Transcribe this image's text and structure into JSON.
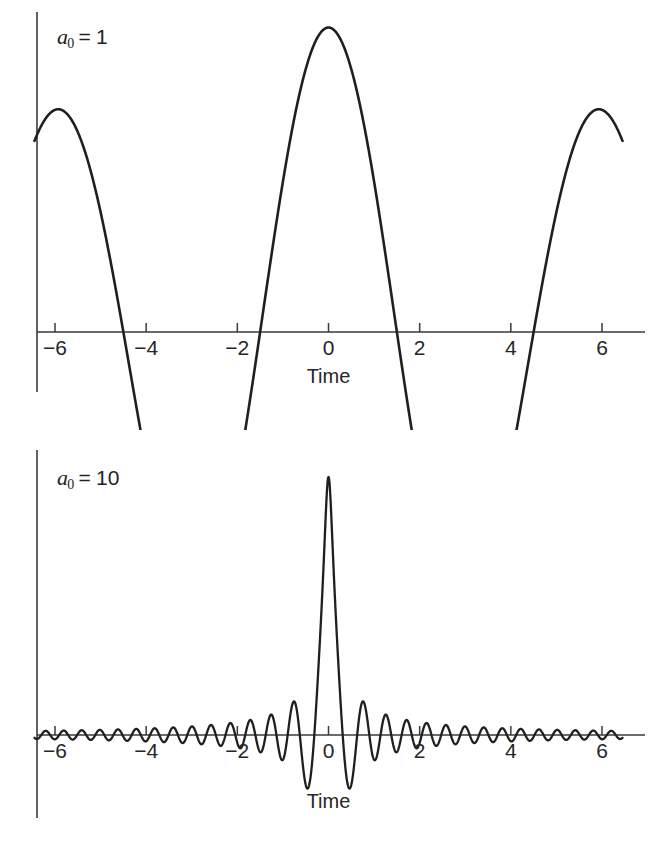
{
  "figure": {
    "background": "#ffffff",
    "line_color": "#1f1f1f",
    "axis_color": "#3a3a3a"
  },
  "panels": [
    {
      "id": "panel-top",
      "param_var": "a",
      "param_sub": "0",
      "param_eq": "=",
      "param_value": "1",
      "xlabel": "Time",
      "ticks": [
        "−6",
        "−4",
        "−2",
        "0",
        "2",
        "4",
        "6"
      ]
    },
    {
      "id": "panel-bottom",
      "param_var": "a",
      "param_sub": "0",
      "param_eq": "=",
      "param_value": "10",
      "xlabel": "Time",
      "ticks": [
        "−6",
        "−4",
        "−2",
        "0",
        "2",
        "4",
        "6"
      ]
    }
  ],
  "chart_data": [
    {
      "type": "line",
      "title": "a0 = 1",
      "xlabel": "Time",
      "ylabel": "",
      "xlim": [
        -6.5,
        6.5
      ],
      "ylim": [
        -0.45,
        1.05
      ],
      "grid": false,
      "legend": "none",
      "annotations": [
        {
          "text": "a0 = 1",
          "x": -5.2,
          "y": 0.88
        }
      ],
      "xticks": [
        -6,
        -4,
        -2,
        0,
        2,
        4,
        6
      ],
      "xticklabels": [
        "−6",
        "−4",
        "−2",
        "0",
        "2",
        "4",
        "6"
      ],
      "yticks": [],
      "description": "Gaussian-windowed linear chirp with chirp parameter a0 = 1; single broad positive lobe centred at t = 0 with shallow negative side lobes near t = ±4.4",
      "x": [
        -6.5,
        -6.2,
        -5.9,
        -5.6,
        -5.3,
        -5.0,
        -4.7,
        -4.4,
        -4.1,
        -3.8,
        -3.5,
        -3.2,
        -2.9,
        -2.6,
        -2.3,
        -2.0,
        -1.7,
        -1.4,
        -1.1,
        -0.8,
        -0.5,
        -0.2,
        0.0,
        0.2,
        0.5,
        0.8,
        1.1,
        1.4,
        1.7,
        2.0,
        2.3,
        2.6,
        2.9,
        3.2,
        3.5,
        3.8,
        4.1,
        4.4,
        4.7,
        5.0,
        5.3,
        5.6,
        5.9,
        6.2,
        6.5
      ],
      "y": [
        -0.12,
        -0.18,
        -0.23,
        -0.26,
        -0.28,
        -0.29,
        -0.29,
        -0.29,
        -0.27,
        -0.24,
        -0.19,
        -0.13,
        -0.05,
        0.04,
        0.15,
        0.27,
        0.4,
        0.53,
        0.66,
        0.78,
        0.89,
        0.97,
        1.0,
        0.97,
        0.89,
        0.78,
        0.66,
        0.53,
        0.4,
        0.27,
        0.15,
        0.04,
        -0.05,
        -0.13,
        -0.19,
        -0.24,
        -0.27,
        -0.29,
        -0.29,
        -0.29,
        -0.28,
        -0.26,
        -0.23,
        -0.18,
        -0.12
      ]
    },
    {
      "type": "line",
      "title": "a0 = 10",
      "xlabel": "Time",
      "ylabel": "",
      "xlim": [
        -6.5,
        6.5
      ],
      "ylim": [
        -0.45,
        1.05
      ],
      "grid": false,
      "legend": "none",
      "annotations": [
        {
          "text": "a0 = 10",
          "x": -5.2,
          "y": 0.82
        }
      ],
      "xticks": [
        -6,
        -4,
        -2,
        0,
        2,
        4,
        6
      ],
      "xticklabels": [
        "−6",
        "−4",
        "−2",
        "0",
        "2",
        "4",
        "6"
      ],
      "yticks": [],
      "description": "Gaussian-windowed linear chirp with chirp parameter a0 = 10; very narrow tall main lobe at t = 0 flanked by deep negative lobes near t = ±0.35 and rapidly oscillating, decaying ripples out to t = ±6",
      "model": {
        "envelope": "1 / sqrt(1 + (a0*t)^2)",
        "phase": "a0 * t^2 / (1 + (a0*t)^2) scaled oscillation",
        "a0": 10,
        "peak_value": 1.0,
        "first_negative_lobe_t": 0.35,
        "first_negative_lobe_value": -0.52,
        "second_positive_lobe_t": 0.66,
        "second_positive_lobe_value": 0.27,
        "ripple_amplitude_at_t6": 0.045
      }
    }
  ]
}
